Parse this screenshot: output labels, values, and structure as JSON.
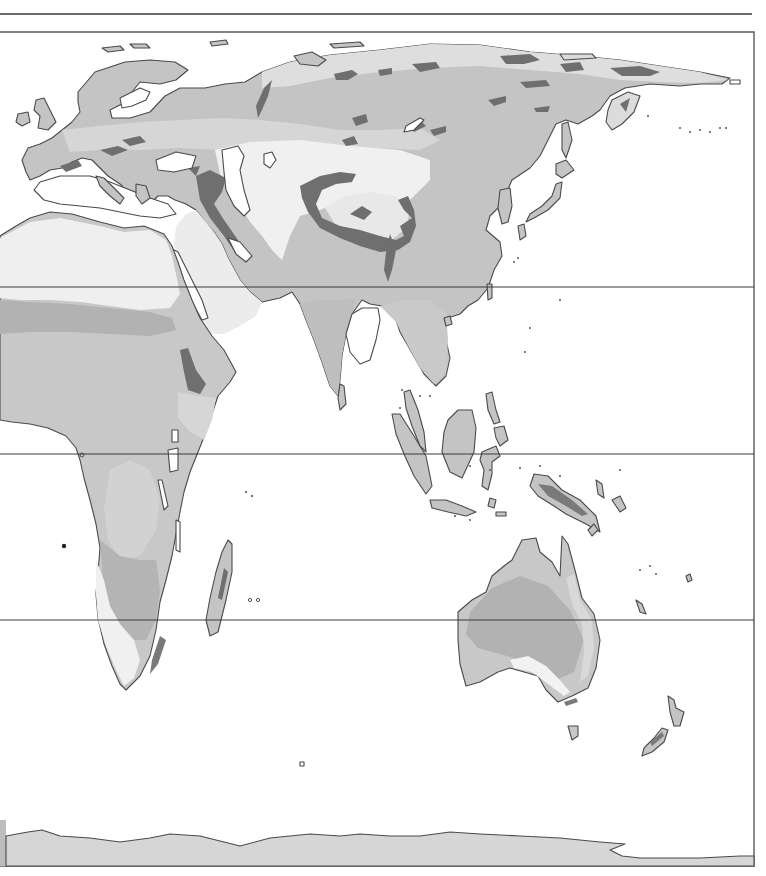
{
  "map": {
    "kind": "physical-zone map",
    "regions_shown": [
      "Europe",
      "Asia",
      "Africa",
      "Australia",
      "Oceania",
      "Antarctica"
    ],
    "labels": [],
    "frame": {
      "top_rule_y": 14,
      "frame_top_y": 32,
      "frame_right_x": 754,
      "frame_bottom_y": 866
    },
    "latitude_lines_y": [
      287,
      454,
      620
    ],
    "palette": {
      "background": "#ffffff",
      "zone_lightest": "#f0f0f0",
      "zone_light": "#dcdcdc",
      "zone_mid": "#c4c4c4",
      "zone_dark": "#ababab",
      "zone_darkest": "#6f6f6f",
      "coastline": "#4a4a4a",
      "rule": "#3a3a3a"
    }
  }
}
